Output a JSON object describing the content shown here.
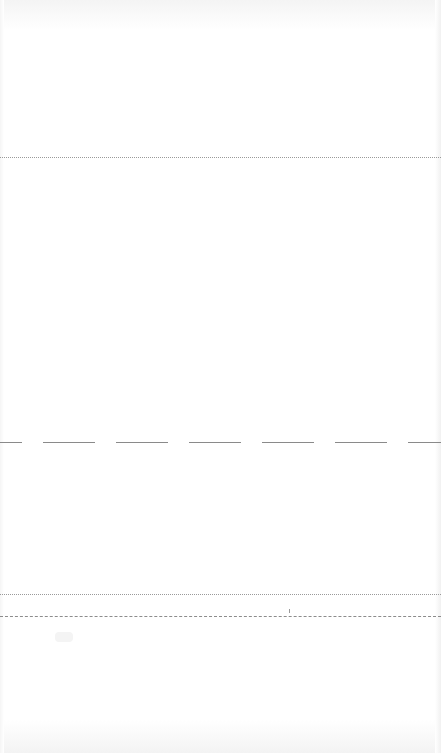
{
  "page": {
    "state": "blank",
    "background_color": "#ffffff"
  },
  "separators": [
    {
      "id": "top-divider",
      "style": "dotted",
      "y": 157,
      "color": "#9a9a9a"
    },
    {
      "id": "middle-divider",
      "style": "long-dash",
      "y": 442,
      "color": "#8a8a8a"
    },
    {
      "id": "lower-divider",
      "style": "dotted",
      "y": 594,
      "color": "#9a9a9a"
    },
    {
      "id": "bottom-divider",
      "style": "dashed",
      "y": 616,
      "color": "#8c8c8c"
    }
  ],
  "markers": [
    {
      "id": "axis-tick",
      "x": 289,
      "y": 610
    }
  ],
  "footer": {
    "ghost_label_left": "",
    "ghost_label_right": ""
  }
}
